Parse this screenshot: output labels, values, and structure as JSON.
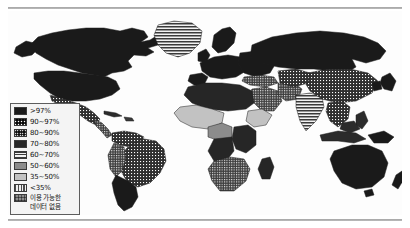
{
  "figure": {
    "kind": "world-choropleth-map",
    "background_color": "#ffffff",
    "ocean_color": "#fdfdfd",
    "outline_color": "#2a2a2a"
  },
  "legend": {
    "name": "map-legend",
    "border_color": "#5d5d5d",
    "background_color": "#f4f4f4",
    "items": [
      {
        "label": ">97%",
        "fill": "#1a1a1a",
        "pattern": "solid"
      },
      {
        "label": "90~97%",
        "fill": "#2b2b2b",
        "pattern": "dots-light"
      },
      {
        "label": "80~90%",
        "fill": "#3a3a3a",
        "pattern": "dots-dense"
      },
      {
        "label": "70~80%",
        "fill": "#262626",
        "pattern": "solid-dark"
      },
      {
        "label": "60~70%",
        "fill": "#4a4a4a",
        "pattern": "hlines"
      },
      {
        "label": "50~60%",
        "fill": "#8c8c8c",
        "pattern": "solid-mid"
      },
      {
        "label": "35~50%",
        "fill": "#c2c2c2",
        "pattern": "solid-light"
      },
      {
        "label": "<35%",
        "fill": "#6e6e6e",
        "pattern": "vlines"
      },
      {
        "label": "이용 가능한",
        "label_line2": "데이터 없음",
        "fill": "#9a9a9a",
        "pattern": "crosshatch"
      }
    ]
  },
  "map_regions": [
    {
      "name": "north-america-canada",
      "category": ">97%"
    },
    {
      "name": "north-america-usa",
      "category": ">97%"
    },
    {
      "name": "greenland",
      "category": "60~70%"
    },
    {
      "name": "mexico",
      "category": "90~97%"
    },
    {
      "name": "central-america",
      "category": "80~90%"
    },
    {
      "name": "caribbean",
      "category": "80~90%"
    },
    {
      "name": "brazil",
      "category": "90~97%"
    },
    {
      "name": "andean-south-america",
      "category": "90~97%"
    },
    {
      "name": "southern-cone",
      "category": ">97%"
    },
    {
      "name": "europe-west",
      "category": ">97%"
    },
    {
      "name": "europe-east",
      "category": ">97%"
    },
    {
      "name": "russia",
      "category": ">97%"
    },
    {
      "name": "north-africa",
      "category": "70~80%"
    },
    {
      "name": "sahel-west-africa",
      "category": "35~50%"
    },
    {
      "name": "horn-of-africa",
      "category": "35~50%"
    },
    {
      "name": "central-africa",
      "category": "70~80%"
    },
    {
      "name": "southern-africa",
      "category": "80~90%"
    },
    {
      "name": "madagascar",
      "category": "70~80%"
    },
    {
      "name": "middle-east",
      "category": "80~90%"
    },
    {
      "name": "india-subcontinent",
      "category": "60~70%"
    },
    {
      "name": "china",
      "category": "90~97%"
    },
    {
      "name": "southeast-asia",
      "category": "90~97%"
    },
    {
      "name": "indonesia",
      "category": "90~97%"
    },
    {
      "name": "japan-korea",
      "category": ">97%"
    },
    {
      "name": "australia",
      "category": ">97%"
    },
    {
      "name": "new-zealand",
      "category": ">97%"
    }
  ]
}
